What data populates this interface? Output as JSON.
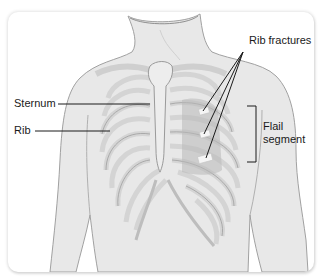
{
  "figure": {
    "labels": {
      "rib_fractures": "Rib fractures",
      "sternum": "Sternum",
      "rib": "Rib",
      "flail_line1": "Flail",
      "flail_line2": "segment"
    },
    "colors": {
      "skin": "#e6e6e6",
      "skin_outline": "#9a9a9a",
      "bone": "#dcdcdc",
      "bone_outline": "#a8a8a8",
      "flail_shade": "#b9b9b9",
      "fracture": "#f4f4f4",
      "leader_line": "#1a1a1a",
      "frame_bg": "#ffffff"
    }
  }
}
